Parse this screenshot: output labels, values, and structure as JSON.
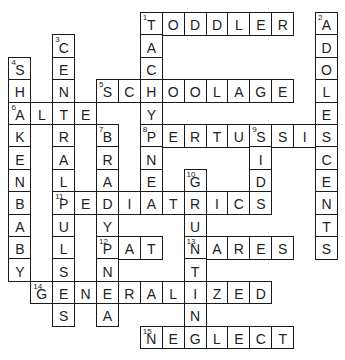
{
  "puzzle": {
    "type": "crossword",
    "grid": {
      "origin_x": 8.4,
      "origin_y": 12,
      "cell_w": 21.9,
      "cell_h": 22.4
    },
    "words": [
      {
        "number": "1",
        "direction": "across",
        "answer": "TODDLER",
        "row": 0,
        "col": 6
      },
      {
        "number": "1",
        "direction": "down",
        "answer": "TACHYPNEA",
        "row": 0,
        "col": 6
      },
      {
        "number": "2",
        "direction": "down",
        "answer": "ADOLESCENTS",
        "row": 0,
        "col": 14
      },
      {
        "number": "3",
        "direction": "down",
        "answer": "CENTRALPULSES",
        "row": 1,
        "col": 2
      },
      {
        "number": "4",
        "direction": "down",
        "answer": "SHAKENBABY",
        "row": 2,
        "col": 0
      },
      {
        "number": "5",
        "direction": "across",
        "answer": "SCHOOLAGE",
        "row": 3,
        "col": 4
      },
      {
        "number": "6",
        "direction": "across",
        "answer": "ALTE",
        "row": 4,
        "col": 0
      },
      {
        "number": "7",
        "direction": "down",
        "answer": "BRADYPNEA",
        "row": 5,
        "col": 4
      },
      {
        "number": "8",
        "direction": "across",
        "answer": "PERTUSSIS",
        "row": 5,
        "col": 6
      },
      {
        "number": "9",
        "direction": "down",
        "answer": "SIDS",
        "row": 5,
        "col": 11
      },
      {
        "number": "10",
        "direction": "down",
        "answer": "GRUNTING",
        "row": 7,
        "col": 8
      },
      {
        "number": "11",
        "direction": "across",
        "answer": "PEDIATRICS",
        "row": 8,
        "col": 2
      },
      {
        "number": "12",
        "direction": "across",
        "answer": "PAT",
        "row": 10,
        "col": 4
      },
      {
        "number": "13",
        "direction": "across",
        "answer": "NARES",
        "row": 10,
        "col": 8
      },
      {
        "number": "14",
        "direction": "across",
        "answer": "GENERALIZED",
        "row": 12,
        "col": 1
      },
      {
        "number": "15",
        "direction": "across",
        "answer": "NEGLECT",
        "row": 14,
        "col": 6
      }
    ]
  }
}
